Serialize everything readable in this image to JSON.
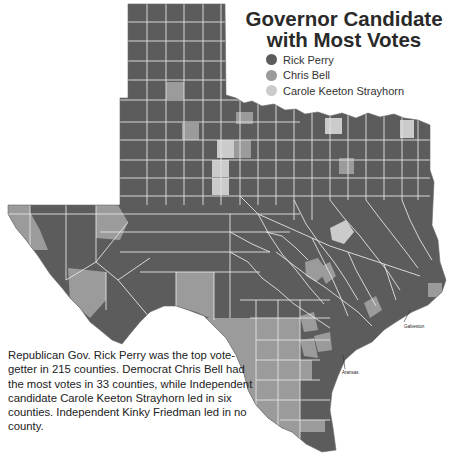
{
  "title": {
    "line1": "Governor Candidate",
    "line2": "with Most Votes"
  },
  "legend": {
    "items": [
      {
        "label": "Rick Perry",
        "color": "#5c5c5c"
      },
      {
        "label": "Chris Bell",
        "color": "#9b9b9b"
      },
      {
        "label": "Carole Keeton Strayhorn",
        "color": "#cbcbcb"
      }
    ]
  },
  "caption": "Republican Gov. Rick Perry was the top vote-getter in 215 counties. Democrat Chris Bell had the most votes in 33 counties, while Independent candidate Carole Keeton Strayhorn led in six counties. Independent Kinky Friedman led in no county.",
  "callouts": {
    "galveston": "Galveston",
    "aransas": "Aransas"
  },
  "colors": {
    "perry": "#5c5c5c",
    "bell": "#9b9b9b",
    "strayhorn": "#cbcbcb",
    "border": "#e4e4e4"
  },
  "counts": {
    "perry": 215,
    "bell": 33,
    "strayhorn": 6,
    "friedman": 0
  },
  "counties": {
    "panhandle_row1": [
      "Dallam",
      "Sherman",
      "Hansford",
      "Ochiltree",
      "Lipscomb"
    ],
    "panhandle_row2": [
      "Hartley",
      "Moore",
      "Hutchinson",
      "Roberts",
      "Hemphill"
    ],
    "panhandle_row3": [
      "Oldham",
      "Potter",
      "Carson",
      "Gray",
      "Wheeler"
    ],
    "panhandle_row4": [
      "Deaf Smith",
      "Randall",
      "Armstrong",
      "Donley",
      "Collingsworth"
    ],
    "panhandle_row5": [
      "Parmer",
      "Castro",
      "Swisher",
      "Briscoe",
      "Hall",
      "Childress"
    ],
    "panhandle_row6": [
      "Bailey",
      "Lamb",
      "Hale",
      "Floyd",
      "Motley",
      "Cottle"
    ],
    "west": [
      "El Paso",
      "Hudspeth",
      "Culberson",
      "Reeves",
      "Jeff Davis",
      "Presidio",
      "Brewster",
      "Pecos",
      "Terrell",
      "Val Verde"
    ],
    "south": [
      "Maverick",
      "Dimmit",
      "Webb",
      "Zapata",
      "Starr",
      "Hidalgo",
      "Cameron",
      "Willacy",
      "Kenedy",
      "Brooks",
      "Jim Hogg",
      "Duval",
      "Jim Wells",
      "Kleberg",
      "Nueces"
    ],
    "gulf": [
      "Galveston",
      "Brazoria",
      "Matagorda",
      "Calhoun",
      "Aransas",
      "Refugio",
      "Jackson",
      "Wharton",
      "Fort Bend",
      "Harris",
      "Chambers",
      "Jefferson"
    ]
  }
}
